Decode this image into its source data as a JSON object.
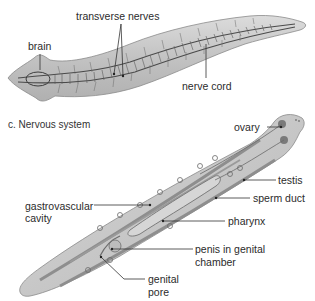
{
  "figure": {
    "panels": [
      {
        "id": "nervous",
        "caption": "c. Nervous system",
        "labels": {
          "brain": "brain",
          "transverse_nerves": "transverse nerves",
          "nerve_cord": "nerve cord"
        }
      },
      {
        "id": "reproductive",
        "labels": {
          "ovary": "ovary",
          "testis": "testis",
          "sperm_duct": "sperm duct",
          "gastrovascular_1": "gastrovascular",
          "gastrovascular_2": "cavity",
          "pharynx": "pharynx",
          "penis_1": "penis in genital",
          "penis_2": "chamber",
          "genital_pore_1": "genital",
          "genital_pore_2": "pore"
        }
      }
    ],
    "colors": {
      "body_fill": "#c9c9c9",
      "body_edge": "#8a8a8a",
      "nerve": "#4a4a4a",
      "leader": "#333333",
      "text": "#2b2b2b"
    }
  }
}
